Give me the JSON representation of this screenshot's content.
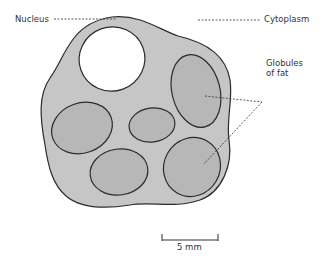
{
  "diagram": {
    "labels": {
      "nucleus": "Nucleus",
      "cytoplasm": "Cytoplasm",
      "globules_line1": "Globules",
      "globules_line2": "of fat"
    },
    "scale_bar": {
      "label": "5 mm"
    },
    "colors": {
      "cytoplasm_fill": "#c6c6c6",
      "globule_fill": "#b7b7b7",
      "nucleus_fill": "#ffffff",
      "outline": "#2b2b2b",
      "leader_line": "#333333",
      "text": "#333333"
    }
  }
}
